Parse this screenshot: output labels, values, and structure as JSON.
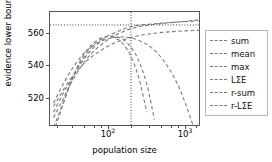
{
  "chart_data": {
    "type": "line",
    "title": "",
    "xlabel": "population size",
    "ylabel": "evidence lower bound",
    "xscale": "log",
    "yscale": "linear",
    "xlim": [
      18,
      1600
    ],
    "ylim": [
      508,
      570
    ],
    "grid": false,
    "legend_position": "right-outside",
    "xticks": [
      {
        "value": 100,
        "label": "10",
        "exponent": "2"
      },
      {
        "value": 1000,
        "label": "10",
        "exponent": "3"
      }
    ],
    "yticks": [
      520,
      540,
      560
    ],
    "annotations": [
      {
        "name": "elbo-reference-line",
        "type": "hline",
        "y": 563,
        "style": "dotted"
      },
      {
        "name": "optimal-population-line",
        "type": "vline",
        "x": 200,
        "style": "dotted"
      }
    ],
    "series": [
      {
        "name": "sum",
        "x": [
          20,
          25,
          32,
          40,
          50,
          63,
          80,
          100,
          126,
          160,
          200,
          250,
          320,
          400,
          500,
          630,
          800,
          1000,
          1260,
          1500
        ],
        "y": [
          513,
          521,
          530,
          537,
          543,
          548,
          552,
          555,
          557.5,
          559.5,
          561,
          562,
          562.8,
          563.4,
          563.8,
          564.2,
          564.6,
          565,
          565.4,
          565.7
        ]
      },
      {
        "name": "mean",
        "x": [
          20,
          25,
          32,
          40,
          50,
          63,
          80,
          100,
          126,
          160,
          200,
          250,
          320,
          400,
          500,
          630,
          800,
          1000,
          1260,
          1500
        ],
        "y": [
          519,
          526,
          533,
          538,
          542.5,
          546,
          549,
          551.5,
          553.5,
          555,
          556.2,
          557.2,
          558,
          558.5,
          559,
          559.3,
          559.6,
          559.8,
          560,
          560.1
        ]
      },
      {
        "name": "max",
        "x": [
          20,
          25,
          32,
          40,
          50,
          63,
          80,
          100,
          126,
          160,
          200,
          250,
          320,
          400,
          500,
          630,
          800,
          1000,
          1260
        ],
        "y": [
          521,
          529,
          537,
          543,
          548,
          551.5,
          554,
          555.5,
          556.3,
          556.5,
          556,
          554.8,
          552.5,
          549.5,
          545,
          539,
          531,
          521,
          509
        ]
      },
      {
        "name": "LΣE",
        "x": [
          20,
          25,
          32,
          40,
          50,
          63,
          80,
          100,
          126,
          160,
          200,
          250,
          320,
          400,
          500,
          630,
          800,
          1000,
          1260,
          1500
        ],
        "y": [
          516,
          524,
          532,
          539,
          545,
          550,
          554,
          557,
          559,
          560.8,
          562,
          562.8,
          563.3,
          563.7,
          564,
          564.3,
          564.6,
          564.8,
          565.1,
          565.3
        ]
      },
      {
        "name": "r-sum",
        "x": [
          20,
          25,
          32,
          40,
          50,
          63,
          80,
          100,
          126,
          160,
          200,
          250,
          320,
          400
        ],
        "y": [
          508,
          518,
          530,
          539,
          546,
          551.5,
          555,
          556.8,
          556.8,
          555,
          551,
          544,
          531,
          512
        ]
      },
      {
        "name": "r-LΣE",
        "x": [
          20,
          25,
          32,
          40,
          50,
          63,
          80,
          100,
          126,
          160,
          200,
          250,
          320
        ],
        "y": [
          505,
          517,
          530,
          540,
          547.5,
          552.5,
          555.8,
          556.8,
          556,
          552.5,
          546,
          535,
          516
        ]
      }
    ]
  },
  "axes": {
    "ylabel": "evidence lower bound",
    "xlabel": "population size",
    "ytick_labels": [
      "560",
      "540",
      "520"
    ],
    "xtick_labels": [
      {
        "mantissa": "10",
        "exp": "2"
      },
      {
        "mantissa": "10",
        "exp": "3"
      }
    ]
  },
  "legend": {
    "entries": [
      {
        "label": "sum"
      },
      {
        "label": "mean"
      },
      {
        "label": "max"
      },
      {
        "label": "LΣE"
      },
      {
        "label": "r-sum"
      },
      {
        "label": "r-LΣE"
      }
    ]
  },
  "colors": {
    "line": "#7a7a7a",
    "axis": "#555555",
    "text": "#000000",
    "legend_border": "#b8b8b8",
    "background": "#ffffff"
  }
}
